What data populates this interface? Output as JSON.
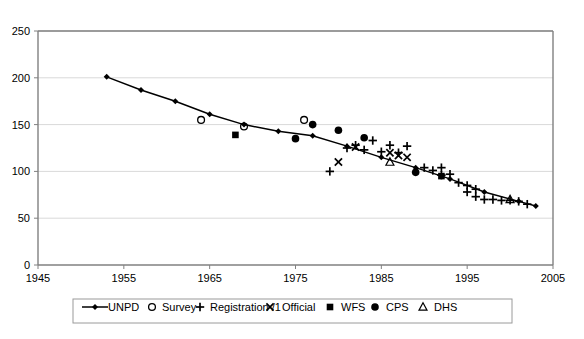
{
  "chart_data": {
    "type": "scatter",
    "title": "",
    "xlabel": "",
    "ylabel": "",
    "xlim": [
      1945,
      2005
    ],
    "ylim": [
      0,
      250
    ],
    "xticks": [
      1945,
      1955,
      1965,
      1975,
      1985,
      1995,
      2005
    ],
    "yticks": [
      0,
      50,
      100,
      150,
      200,
      250
    ],
    "grid": "horizontal",
    "legend_position": "bottom",
    "series": [
      {
        "name": "UNPD",
        "marker": "line-diamond",
        "points": [
          {
            "x": 1953,
            "y": 201
          },
          {
            "x": 1957,
            "y": 187
          },
          {
            "x": 1961,
            "y": 175
          },
          {
            "x": 1965,
            "y": 161
          },
          {
            "x": 1969,
            "y": 150
          },
          {
            "x": 1973,
            "y": 143
          },
          {
            "x": 1977,
            "y": 138
          },
          {
            "x": 1981,
            "y": 127
          },
          {
            "x": 1985,
            "y": 115
          },
          {
            "x": 1989,
            "y": 104
          },
          {
            "x": 1993,
            "y": 92
          },
          {
            "x": 1997,
            "y": 78
          },
          {
            "x": 2001,
            "y": 68
          },
          {
            "x": 2003,
            "y": 63
          }
        ]
      },
      {
        "name": "Survey",
        "marker": "open-circle",
        "points": [
          {
            "x": 1964,
            "y": 155
          },
          {
            "x": 1969,
            "y": 148
          },
          {
            "x": 1976,
            "y": 155
          }
        ]
      },
      {
        "name": "Registration /1",
        "marker": "plus",
        "points": [
          {
            "x": 1979,
            "y": 100
          },
          {
            "x": 1981,
            "y": 125
          },
          {
            "x": 1982,
            "y": 128
          },
          {
            "x": 1983,
            "y": 123
          },
          {
            "x": 1984,
            "y": 133
          },
          {
            "x": 1985,
            "y": 121
          },
          {
            "x": 1986,
            "y": 128
          },
          {
            "x": 1987,
            "y": 120
          },
          {
            "x": 1988,
            "y": 127
          },
          {
            "x": 1990,
            "y": 104
          },
          {
            "x": 1991,
            "y": 101
          },
          {
            "x": 1992,
            "y": 104
          },
          {
            "x": 1992,
            "y": 96
          },
          {
            "x": 1993,
            "y": 97
          },
          {
            "x": 1994,
            "y": 88
          },
          {
            "x": 1995,
            "y": 85
          },
          {
            "x": 1995,
            "y": 78
          },
          {
            "x": 1996,
            "y": 81
          },
          {
            "x": 1996,
            "y": 73
          },
          {
            "x": 1997,
            "y": 70
          },
          {
            "x": 1998,
            "y": 70
          },
          {
            "x": 1999,
            "y": 69
          },
          {
            "x": 2000,
            "y": 69
          },
          {
            "x": 2001,
            "y": 68
          },
          {
            "x": 2002,
            "y": 65
          }
        ]
      },
      {
        "name": "Official",
        "marker": "cross",
        "points": [
          {
            "x": 1980,
            "y": 110
          },
          {
            "x": 1982,
            "y": 126
          },
          {
            "x": 1986,
            "y": 120
          },
          {
            "x": 1987,
            "y": 117
          },
          {
            "x": 1988,
            "y": 115
          }
        ]
      },
      {
        "name": "WFS",
        "marker": "filled-square",
        "points": [
          {
            "x": 1968,
            "y": 139
          },
          {
            "x": 1992,
            "y": 95
          }
        ]
      },
      {
        "name": "CPS",
        "marker": "filled-circle",
        "points": [
          {
            "x": 1975,
            "y": 135
          },
          {
            "x": 1977,
            "y": 150
          },
          {
            "x": 1980,
            "y": 144
          },
          {
            "x": 1983,
            "y": 136
          },
          {
            "x": 1989,
            "y": 99
          }
        ]
      },
      {
        "name": "DHS",
        "marker": "open-triangle",
        "points": [
          {
            "x": 1986,
            "y": 110
          },
          {
            "x": 2000,
            "y": 70
          }
        ]
      }
    ]
  },
  "legend": {
    "entries": [
      {
        "label": "UNPD",
        "marker": "line-diamond"
      },
      {
        "label": "Survey",
        "marker": "open-circle"
      },
      {
        "label": "Registration /1",
        "marker": "plus"
      },
      {
        "label": "Official",
        "marker": "cross"
      },
      {
        "label": "WFS",
        "marker": "filled-square"
      },
      {
        "label": "CPS",
        "marker": "filled-circle"
      },
      {
        "label": "DHS",
        "marker": "open-triangle"
      }
    ]
  },
  "colors": {
    "series": "#000000",
    "axis": "#808080",
    "grid": "#d9d9d9",
    "background": "#ffffff"
  }
}
